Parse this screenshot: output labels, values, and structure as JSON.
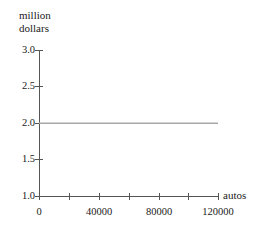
{
  "chart_data": {
    "type": "line",
    "title": "",
    "subtitle": "",
    "ylabel_line1": "million",
    "ylabel_line2": "dollars",
    "xlabel": "autos",
    "x": [
      0,
      120000
    ],
    "values": [
      2.0,
      2.0
    ],
    "series": [
      {
        "name": "revenue",
        "x": [
          0,
          120000
        ],
        "values": [
          2.0,
          2.0
        ],
        "color": "#a8a8a8"
      }
    ],
    "xlim": [
      0,
      120000
    ],
    "ylim": [
      1.0,
      3.0
    ],
    "grid": false,
    "legend": false,
    "legend_position": "none",
    "y_tick_labels": [
      "3.0",
      "2.5",
      "2.0",
      "1.5",
      "1.0"
    ],
    "y_tick_values": [
      3.0,
      2.5,
      2.0,
      1.5,
      1.0
    ],
    "x_tick_labels": [
      "0",
      "40000",
      "80000",
      "120000"
    ],
    "x_tick_values": [
      0,
      40000,
      80000,
      120000
    ],
    "x_minor_tick_values": [
      20000,
      60000,
      100000
    ],
    "axis_color": "#555555",
    "line_color": "#a8a8a8",
    "background_color": "#ffffff"
  },
  "yticks": {
    "t0": "3.0",
    "t1": "2.5",
    "t2": "2.0",
    "t3": "1.5",
    "t4": "1.0"
  },
  "xticks": {
    "t0": "0",
    "t1": "40000",
    "t2": "80000",
    "t3": "120000"
  },
  "labels": {
    "y_line1": "million",
    "y_line2": "dollars",
    "x_axis": "autos"
  }
}
